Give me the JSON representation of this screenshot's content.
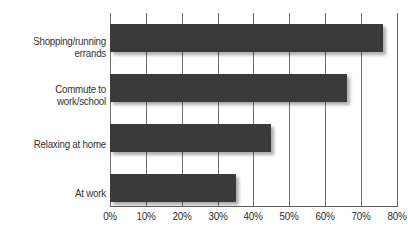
{
  "chart_data": {
    "type": "bar",
    "orientation": "horizontal",
    "title": "",
    "subtitle": "",
    "xlabel": "",
    "ylabel": "",
    "categories": [
      "Shopping/running\nerrands",
      "Commute to\nwork/school",
      "Relaxing at home",
      "At work"
    ],
    "values": [
      76,
      66,
      45,
      35
    ],
    "value_suffix": "%",
    "xlim": [
      0,
      80
    ],
    "xticks": [
      0,
      10,
      20,
      30,
      40,
      50,
      60,
      70,
      80
    ],
    "xtick_labels": [
      "0%",
      "10%",
      "20%",
      "30%",
      "40%",
      "50%",
      "60%",
      "70%",
      "80%"
    ],
    "grid": "vertical",
    "legend": "none",
    "bar_color": "#3a3a3a",
    "gridline_color": "#6f6f6f",
    "axis_color": "#5c5c5c",
    "label_color": "#333333",
    "background_color": "#ffffff"
  }
}
